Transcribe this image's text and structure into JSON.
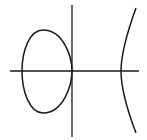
{
  "figure": {
    "background": "#ffffff",
    "stroke": "#1a1a1a",
    "axes": {
      "x_axis": {
        "x1": 10,
        "y1": 71,
        "x2": 139,
        "y2": 71
      },
      "y_axis": {
        "x1": 72,
        "y1": 5,
        "x2": 72,
        "y2": 137
      }
    },
    "oval": {
      "path": "M72,71 C72,58 64,30 43,30 C30,30 22,50 22,71 C22,92 30,113 43,113 C64,113 72,84 72,71 Z"
    },
    "branch": {
      "path": "M136,8 C128,30 121,52 121,71 C121,90 128,112 136,133"
    }
  }
}
